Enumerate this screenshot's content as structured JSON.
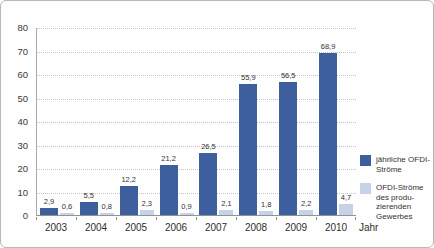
{
  "chart_data": {
    "type": "bar",
    "title": "",
    "categories": [
      "2003",
      "2004",
      "2005",
      "2006",
      "2007",
      "2008",
      "2009",
      "2010"
    ],
    "series": [
      {
        "name": "jährliche OFDI-Ströme",
        "color": "#3d5f9d",
        "values": [
          2.9,
          5.5,
          12.2,
          21.2,
          26.5,
          55.9,
          56.5,
          68.9
        ],
        "labels": [
          "2,9",
          "5,5",
          "12,2",
          "21,2",
          "26,5",
          "55,9",
          "56,5",
          "68,9"
        ]
      },
      {
        "name": "OFDI-Ströme des produzierenden Gewerbes",
        "color": "#c6d2e7",
        "values": [
          0.6,
          0.8,
          2.3,
          0.9,
          2.1,
          1.8,
          2.2,
          4.7
        ],
        "labels": [
          "0,6",
          "0,8",
          "2,3",
          "0,9",
          "2,1",
          "1,8",
          "2,2",
          "4,7"
        ]
      }
    ],
    "xlabel": "Jahr",
    "ylabel": "",
    "ylim": [
      0,
      80
    ],
    "ytick_interval": 10,
    "yticks": [
      "0",
      "10",
      "20",
      "30",
      "40",
      "50",
      "60",
      "70",
      "80"
    ],
    "grid": "horizontal-dotted",
    "legend_position": "right"
  },
  "legend": {
    "items": [
      {
        "lines": [
          "jährliche OFDI-",
          "Ströme"
        ],
        "color": "#3d5f9d"
      },
      {
        "lines": [
          "OFDI-Ströme",
          "des produ-",
          "zierenden",
          "Gewerbes"
        ],
        "color": "#c6d2e7"
      }
    ]
  }
}
